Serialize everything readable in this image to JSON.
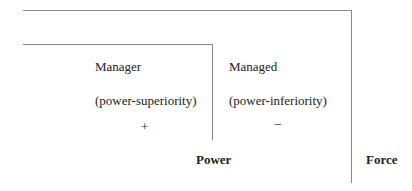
{
  "diagram": {
    "manager": {
      "title": "Manager",
      "subtitle": "(power-superiority)",
      "sign": "+"
    },
    "managed": {
      "title": "Managed",
      "subtitle": "(power-inferiority)",
      "sign": "−"
    },
    "labels": {
      "power": "Power",
      "force": "Force"
    }
  }
}
